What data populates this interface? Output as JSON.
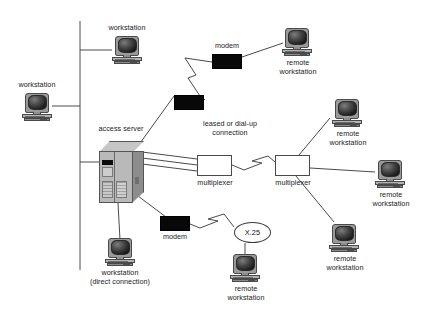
{
  "diagram": {
    "colors": {
      "wire": "#4a4a4a",
      "modem_fill": "#080808",
      "node_fill": "#ffffff",
      "server_front": "#b9b9b9",
      "text": "#1a1a1a"
    },
    "nodes": [
      {
        "id": "ws-top",
        "type": "workstation",
        "label": "workstation",
        "x": 112,
        "y": 38
      },
      {
        "id": "ws-left",
        "type": "workstation",
        "label": "workstation",
        "x": 22,
        "y": 93
      },
      {
        "id": "access-server",
        "type": "server",
        "label": "access server",
        "x": 99,
        "y": 141
      },
      {
        "id": "modem-upper-left",
        "type": "modem",
        "label": "",
        "x": 171,
        "y": 95
      },
      {
        "id": "modem-upper-right",
        "type": "modem",
        "label": "modem",
        "x": 212,
        "y": 54
      },
      {
        "id": "ws-remote-top",
        "type": "workstation",
        "label": "remote\nworkstation",
        "x": 282,
        "y": 28
      },
      {
        "id": "mux-left",
        "type": "multiplexer",
        "label": "multiplexer",
        "x": 197,
        "y": 155
      },
      {
        "id": "mux-right",
        "type": "multiplexer",
        "label": "multiplexer",
        "x": 275,
        "y": 155
      },
      {
        "id": "ws-remote-r1",
        "type": "workstation",
        "label": "remote\nworkstation",
        "x": 332,
        "y": 99
      },
      {
        "id": "ws-remote-r2",
        "type": "workstation",
        "label": "remote\nworkstation",
        "x": 375,
        "y": 160
      },
      {
        "id": "ws-remote-r3",
        "type": "workstation",
        "label": "remote\nworkstation",
        "x": 329,
        "y": 224
      },
      {
        "id": "modem-lower",
        "type": "modem",
        "label": "modem",
        "x": 160,
        "y": 216
      },
      {
        "id": "x25-cloud",
        "type": "cloud",
        "label": "X.25",
        "x": 234,
        "y": 222
      },
      {
        "id": "ws-remote-x25",
        "type": "workstation",
        "label": "remote\nworkstation",
        "x": 230,
        "y": 254
      },
      {
        "id": "ws-direct",
        "type": "workstation",
        "label": "workstation\n(direct connection)",
        "x": 105,
        "y": 238
      }
    ],
    "annotations": [
      {
        "id": "leased-line-label",
        "text": "leased or dial-up\nconnection",
        "x": 189,
        "y": 125
      }
    ],
    "labels": {
      "workstation": "workstation",
      "access_server": "access server",
      "modem": "modem",
      "multiplexer": "multiplexer",
      "x25": "X.25",
      "remote_workstation": "remote\nworkstation",
      "workstation_direct": "workstation\n(direct connection)",
      "leased_or_dialup": "leased or dial-up\nconnection"
    },
    "links": [
      {
        "from": "bus",
        "to": "ws-top",
        "style": "solid"
      },
      {
        "from": "bus",
        "to": "ws-left",
        "style": "solid"
      },
      {
        "from": "bus",
        "to": "access-server",
        "style": "solid"
      },
      {
        "from": "access-server",
        "to": "modem-upper-left",
        "style": "solid"
      },
      {
        "from": "modem-upper-left",
        "to": "modem-upper-right",
        "style": "lightning"
      },
      {
        "from": "modem-upper-right",
        "to": "ws-remote-top",
        "style": "solid"
      },
      {
        "from": "access-server",
        "to": "mux-left",
        "style": "trunk-3"
      },
      {
        "from": "mux-left",
        "to": "mux-right",
        "style": "lightning"
      },
      {
        "from": "mux-right",
        "to": "ws-remote-r1",
        "style": "solid"
      },
      {
        "from": "mux-right",
        "to": "ws-remote-r2",
        "style": "solid"
      },
      {
        "from": "mux-right",
        "to": "ws-remote-r3",
        "style": "solid"
      },
      {
        "from": "access-server",
        "to": "modem-lower",
        "style": "solid"
      },
      {
        "from": "modem-lower",
        "to": "x25-cloud",
        "style": "lightning"
      },
      {
        "from": "x25-cloud",
        "to": "ws-remote-x25",
        "style": "solid"
      },
      {
        "from": "access-server",
        "to": "ws-direct",
        "style": "solid"
      }
    ]
  }
}
